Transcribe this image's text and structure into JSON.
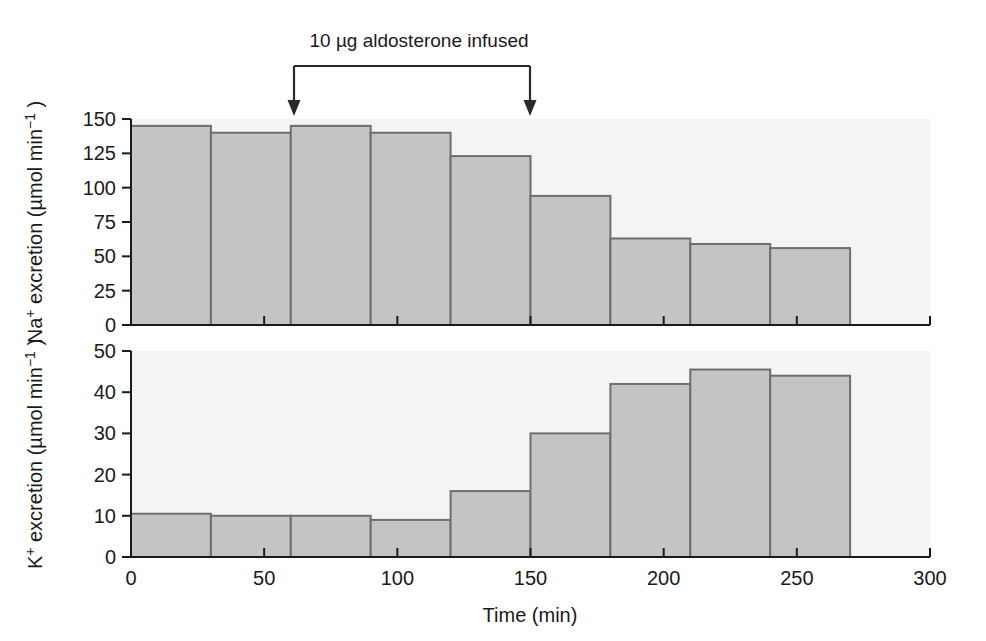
{
  "figure": {
    "background_color": "#ffffff",
    "plot_background_color": "#f4f4f4",
    "bar_fill_color": "#c4c4c4",
    "bar_edge_color": "#6e6e6e",
    "axis_color": "#1a1a1a"
  },
  "annotation": {
    "label": "10 µg aldosterone infused",
    "start_time": 60,
    "end_time": 150,
    "arrow_count": 2
  },
  "chart_data": [
    {
      "type": "bar",
      "id": "sodium-excretion",
      "title": "",
      "xlabel": "Time (min)",
      "ylabel": "Na⁺ excretion (µmol min⁻¹)",
      "ylabel_parts": {
        "prefix": "Na",
        "superscript": "+",
        "middle": " excretion (µmol min",
        "exponent": "−1",
        "suffix": " )"
      },
      "xlim": [
        0,
        300
      ],
      "ylim": [
        0,
        150
      ],
      "yticks": [
        0,
        25,
        50,
        75,
        100,
        125,
        150
      ],
      "ytick_labels": [
        "0",
        "25",
        "50",
        "75",
        "100",
        "125",
        "150"
      ],
      "xticks": [
        0,
        50,
        100,
        150,
        200,
        250,
        300
      ],
      "xtick_labels": [
        "0",
        "50",
        "100",
        "150",
        "200",
        "250",
        "300"
      ],
      "grid": false,
      "bin_width": 30,
      "bin_edges": [
        0,
        30,
        60,
        90,
        120,
        150,
        180,
        210,
        240,
        270
      ],
      "x": [
        15,
        45,
        75,
        105,
        135,
        165,
        195,
        225,
        255
      ],
      "values": [
        145,
        140,
        145,
        140,
        123,
        94,
        63,
        59,
        56
      ]
    },
    {
      "type": "bar",
      "id": "potassium-excretion",
      "title": "",
      "xlabel": "Time (min)",
      "ylabel": "K⁺ excretion (µmol min⁻¹)",
      "ylabel_parts": {
        "prefix": "K",
        "superscript": "+",
        "middle": " excretion (µmol min",
        "exponent": "−1",
        "suffix": " )"
      },
      "xlim": [
        0,
        300
      ],
      "ylim": [
        0,
        50
      ],
      "yticks": [
        0,
        10,
        20,
        30,
        40,
        50
      ],
      "ytick_labels": [
        "0",
        "10",
        "20",
        "30",
        "40",
        "50"
      ],
      "xticks": [
        0,
        50,
        100,
        150,
        200,
        250,
        300
      ],
      "xtick_labels": [
        "0",
        "50",
        "100",
        "150",
        "200",
        "250",
        "300"
      ],
      "grid": false,
      "bin_width": 30,
      "bin_edges": [
        0,
        30,
        60,
        90,
        120,
        150,
        180,
        210,
        240,
        270
      ],
      "x": [
        15,
        45,
        75,
        105,
        135,
        165,
        195,
        225,
        255
      ],
      "values": [
        10.5,
        10,
        10,
        9,
        16,
        30,
        42,
        45.5,
        44
      ]
    }
  ]
}
